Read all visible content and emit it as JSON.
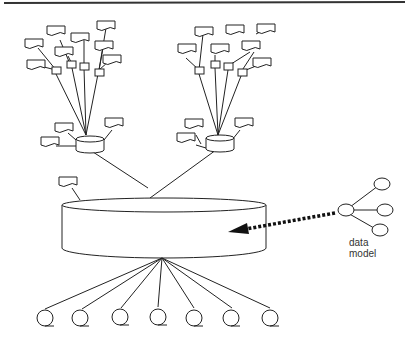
{
  "diagram": {
    "type": "hierarchical-database-architecture",
    "top_rule": true,
    "central_database": {
      "label": ""
    },
    "subsystems": [
      {
        "name": "left-cluster",
        "local_db": true,
        "intermediate_nodes": 4,
        "document_leaves": 9
      },
      {
        "name": "right-cluster",
        "local_db": true,
        "intermediate_nodes": 4,
        "document_leaves": 9
      }
    ],
    "clients": 7,
    "data_model": {
      "label_line1": "data",
      "label_line2": "model",
      "nodes": 4
    },
    "arrow": {
      "style": "dashed",
      "direction": "data-model-to-central-db"
    },
    "colors": {
      "stroke": "#222222",
      "background": "#ffffff"
    }
  }
}
